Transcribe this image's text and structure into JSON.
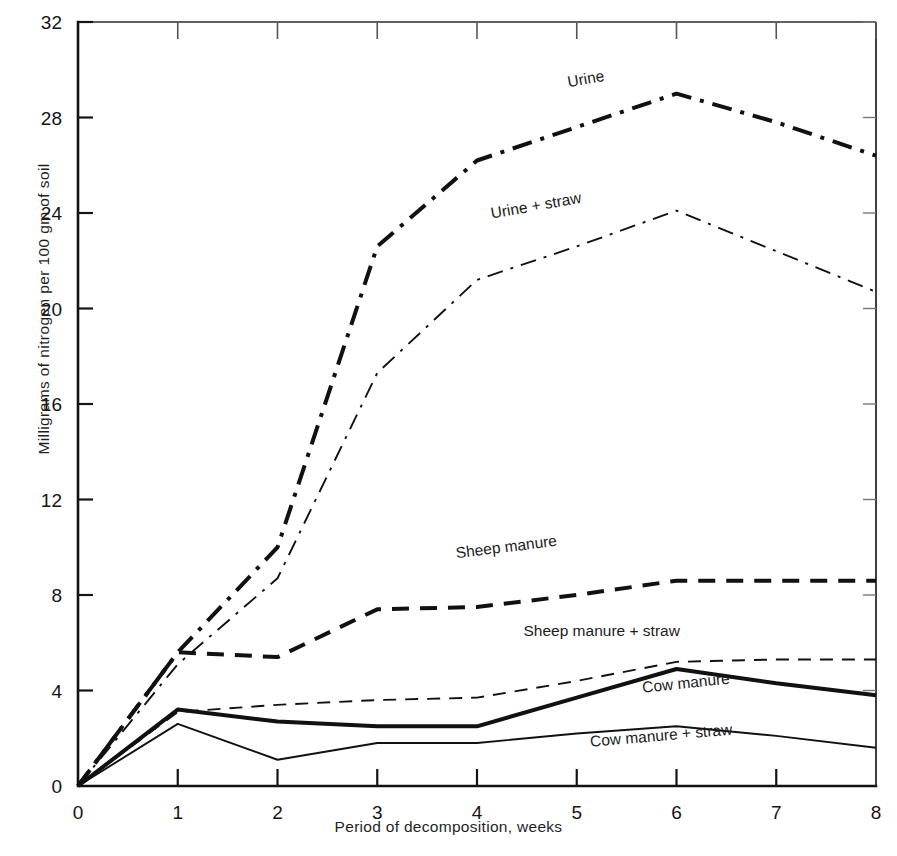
{
  "chart_data": {
    "type": "line",
    "title": "",
    "subtitle": "",
    "xlabel": "Period of decomposition, weeks",
    "ylabel": "Milligrams of nitrogen per 100 gm of soil",
    "xlim": [
      0,
      8
    ],
    "ylim": [
      0,
      32
    ],
    "xticks": [
      "0",
      "1",
      "2",
      "3",
      "4",
      "5",
      "6",
      "7",
      "8"
    ],
    "yticks": [
      "0",
      "4",
      "8",
      "12",
      "16",
      "20",
      "24",
      "28",
      "32"
    ],
    "grid": false,
    "legend_position": "inline-labels",
    "x": [
      0,
      1,
      2,
      3,
      4,
      5,
      6,
      7,
      8
    ],
    "series": [
      {
        "name": "Urine",
        "label": "Urine",
        "style": "dashdot",
        "width": "thick",
        "color": "#111111",
        "values": [
          0.0,
          5.6,
          10.0,
          22.6,
          26.2,
          27.6,
          29.0,
          27.8,
          26.4
        ],
        "label_x": 5.1,
        "label_y": 29.4,
        "label_rotate": -10
      },
      {
        "name": "Urine + straw",
        "label": "Urine + straw",
        "style": "dashdot",
        "width": "thin",
        "color": "#111111",
        "values": [
          0.0,
          5.1,
          8.7,
          17.3,
          21.2,
          22.6,
          24.1,
          22.4,
          20.7
        ],
        "label_x": 4.6,
        "label_y": 24.1,
        "label_rotate": -10
      },
      {
        "name": "Sheep manure",
        "label": "Sheep manure",
        "style": "dashed",
        "width": "thick",
        "color": "#111111",
        "values": [
          0.0,
          5.6,
          5.4,
          7.4,
          7.5,
          8.0,
          8.6,
          8.6,
          8.6
        ],
        "label_x": 4.3,
        "label_y": 9.8,
        "label_rotate": -7
      },
      {
        "name": "Sheep manure + straw",
        "label": "Sheep manure + straw",
        "style": "dashed",
        "width": "thin",
        "color": "#111111",
        "values": [
          0.0,
          3.1,
          3.4,
          3.6,
          3.7,
          4.4,
          5.2,
          5.3,
          5.3
        ],
        "label_x": 5.25,
        "label_y": 6.3,
        "label_rotate": 0
      },
      {
        "name": "Cow manure",
        "label": "Cow manure",
        "style": "solid",
        "width": "thick",
        "color": "#111111",
        "values": [
          0.0,
          3.2,
          2.7,
          2.5,
          2.5,
          3.7,
          4.9,
          4.3,
          3.8
        ],
        "label_x": 6.1,
        "label_y": 4.1,
        "label_rotate": -6
      },
      {
        "name": "Cow manure + straw",
        "label": "Cow manure + straw",
        "style": "solid",
        "width": "thin",
        "color": "#111111",
        "values": [
          0.0,
          2.6,
          1.1,
          1.8,
          1.8,
          2.2,
          2.5,
          2.1,
          1.6
        ],
        "label_x": 5.85,
        "label_y": 1.9,
        "label_rotate": -5
      }
    ]
  },
  "axes": {
    "x_title": "Period of decomposition, weeks",
    "y_title": "Milligrams of nitrogen per 100 gm of soil"
  }
}
